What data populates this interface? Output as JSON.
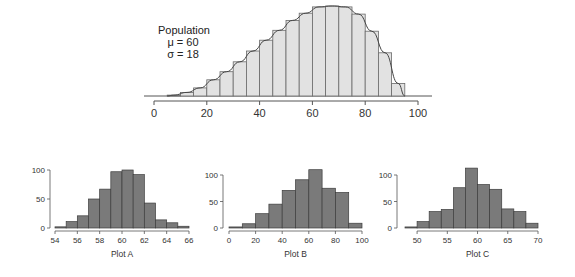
{
  "colors": {
    "population_fill": "#e2e2e2",
    "population_stroke": "#6a6a6a",
    "curve": "#444444",
    "sample_fill": "#7a7a7a",
    "sample_stroke": "#3c3c3c",
    "axis": "#555555"
  },
  "population": {
    "label_lines": [
      "Population",
      "μ = 60",
      "σ = 18"
    ]
  },
  "chart_data": [
    {
      "type": "bar",
      "title": "Population",
      "annotations": [
        "Population",
        "μ = 60",
        "σ = 18"
      ],
      "xlabel": "",
      "ylabel": "",
      "bin_edges": [
        5,
        10,
        15,
        20,
        25,
        30,
        35,
        40,
        45,
        50,
        55,
        60,
        65,
        70,
        75,
        80,
        85,
        90,
        95
      ],
      "values": [
        1,
        4,
        9,
        18,
        27,
        38,
        50,
        62,
        73,
        84,
        92,
        99,
        100,
        99,
        91,
        72,
        48,
        14
      ],
      "x_ticks": [
        0,
        20,
        40,
        60,
        80,
        100
      ],
      "xlim": [
        0,
        100
      ],
      "y_axis_shown": false,
      "overlay": "smooth density curve",
      "grid": false
    },
    {
      "type": "bar",
      "title": "Plot A",
      "xlabel": "Plot A",
      "ylabel": "",
      "bin_edges": [
        54,
        55,
        56,
        57,
        58,
        59,
        60,
        61,
        62,
        63,
        64,
        65,
        66
      ],
      "values": [
        2,
        11,
        21,
        50,
        67,
        97,
        100,
        92,
        43,
        14,
        9,
        3
      ],
      "x_ticks": [
        54,
        56,
        58,
        60,
        62,
        64,
        66
      ],
      "y_ticks": [
        0,
        50,
        100
      ],
      "xlim": [
        54,
        66
      ],
      "ylim": [
        0,
        100
      ],
      "grid": false
    },
    {
      "type": "bar",
      "title": "Plot B",
      "xlabel": "Plot B",
      "ylabel": "",
      "bin_edges": [
        0,
        10,
        20,
        30,
        40,
        50,
        60,
        70,
        80,
        90,
        100
      ],
      "values": [
        2,
        8,
        27,
        45,
        71,
        91,
        110,
        75,
        67,
        9
      ],
      "x_ticks": [
        0,
        20,
        40,
        60,
        80,
        100
      ],
      "y_ticks": [
        0,
        50,
        100
      ],
      "xlim": [
        0,
        100
      ],
      "ylim": [
        0,
        110
      ],
      "grid": false
    },
    {
      "type": "bar",
      "title": "Plot C",
      "xlabel": "Plot C",
      "ylabel": "",
      "bin_edges": [
        48,
        50,
        52,
        54,
        56,
        58,
        60,
        62,
        64,
        66,
        68,
        70
      ],
      "values": [
        2,
        12,
        31,
        35,
        76,
        113,
        82,
        73,
        36,
        31,
        9
      ],
      "x_ticks": [
        50,
        55,
        60,
        65,
        70
      ],
      "y_ticks": [
        0,
        50,
        100
      ],
      "xlim": [
        48,
        70
      ],
      "ylim": [
        0,
        113
      ],
      "grid": false
    }
  ]
}
